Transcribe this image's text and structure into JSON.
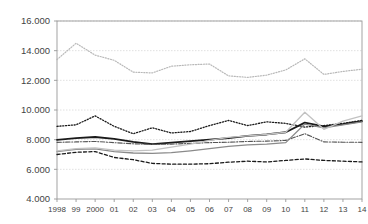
{
  "chart_data": {
    "type": "line",
    "title": "",
    "xlabel": "",
    "ylabel": "",
    "ylim": [
      4000,
      16000
    ],
    "ytick_values": [
      4000,
      6000,
      8000,
      10000,
      12000,
      14000,
      16000
    ],
    "ytick_labels": [
      "4.000",
      "6.000",
      "8.000",
      "10.000",
      "12.000",
      "14.000",
      "16.000"
    ],
    "grid": true,
    "grid_axis": "y",
    "legend": "none",
    "categories": [
      1998,
      1999,
      2000,
      2001,
      2002,
      2003,
      2004,
      2005,
      2006,
      2007,
      2008,
      2009,
      2010,
      2011,
      2012,
      2013,
      2014
    ],
    "xtick_labels": [
      "1998",
      "99",
      "2000",
      "01",
      "02",
      "03",
      "04",
      "05",
      "06",
      "07",
      "08",
      "09",
      "10",
      "11",
      "12",
      "13",
      "14"
    ],
    "series": [
      {
        "name": "series-1",
        "style": "dotted",
        "color": "#b8b8b8",
        "width": 1.2,
        "values": [
          13400,
          14500,
          13700,
          13350,
          12550,
          12500,
          12950,
          13050,
          13100,
          12300,
          12200,
          12350,
          12700,
          13450,
          12400,
          12600,
          12750
        ]
      },
      {
        "name": "series-2",
        "style": "dotted",
        "color": "#1a1a1a",
        "width": 1.3,
        "values": [
          8900,
          9000,
          9600,
          8900,
          8400,
          8800,
          8450,
          8550,
          8950,
          9300,
          8950,
          9200,
          9100,
          8850,
          8950,
          9100,
          9300
        ]
      },
      {
        "name": "series-3",
        "style": "solid",
        "color": "#1a1a1a",
        "width": 1.8,
        "values": [
          7980,
          8100,
          8180,
          8050,
          7850,
          7700,
          7800,
          7900,
          8000,
          8100,
          8250,
          8350,
          8500,
          9150,
          8900,
          9050,
          9250
        ]
      },
      {
        "name": "series-4",
        "style": "dashdot",
        "color": "#555555",
        "width": 1.1,
        "values": [
          7820,
          7850,
          7880,
          7800,
          7720,
          7680,
          7700,
          7750,
          7800,
          7830,
          7880,
          7900,
          7950,
          8400,
          7850,
          7830,
          7820
        ]
      },
      {
        "name": "series-5",
        "style": "solid",
        "color": "#8a8a8a",
        "width": 1.3,
        "values": [
          7200,
          7350,
          7380,
          7200,
          7100,
          7080,
          7120,
          7250,
          7400,
          7550,
          7650,
          7700,
          7800,
          9050,
          8800,
          9000,
          9200
        ]
      },
      {
        "name": "series-6",
        "style": "solid",
        "color": "#c2c2c2",
        "width": 1.3,
        "values": [
          7250,
          7400,
          7450,
          7300,
          7250,
          7300,
          7500,
          7700,
          7950,
          8150,
          8250,
          8350,
          8500,
          9850,
          8700,
          9250,
          9600
        ]
      },
      {
        "name": "series-7",
        "style": "dashed",
        "color": "#1a1a1a",
        "width": 1.3,
        "values": [
          7000,
          7150,
          7200,
          6800,
          6650,
          6400,
          6350,
          6350,
          6380,
          6480,
          6550,
          6500,
          6600,
          6700,
          6600,
          6550,
          6500
        ]
      }
    ]
  },
  "axes": {
    "plot_left": 57,
    "plot_right": 362,
    "plot_top": 21,
    "plot_bottom": 199
  },
  "colors": {
    "background": "#ffffff",
    "frame": "#999999",
    "gridline": "#d8d8d8",
    "tick_text": "#444444"
  }
}
